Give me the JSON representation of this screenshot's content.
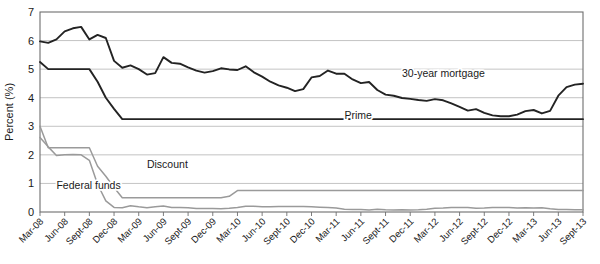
{
  "chart_data": {
    "type": "line",
    "title": "",
    "xlabel": "",
    "ylabel": "Percent (%)",
    "ylim": [
      0,
      7
    ],
    "yticks": [
      0,
      1,
      2,
      3,
      4,
      5,
      6,
      7
    ],
    "grid": true,
    "legend_position": "inline-annotations",
    "x_tick_labels": [
      "Mar-08",
      "Jun-08",
      "Sept-08",
      "Dec-08",
      "Mar-09",
      "Jun-09",
      "Sept-09",
      "Dec-09",
      "Mar-10",
      "Jun-10",
      "Sept-10",
      "Dec-10",
      "Mar-11",
      "Jun-11",
      "Sept-11",
      "Dec-11",
      "Mar-12",
      "Jun-12",
      "Sept-12",
      "Dec-12",
      "Mar-13",
      "Jun-13",
      "Sept-13"
    ],
    "x": [
      "Mar-08",
      "Apr-08",
      "May-08",
      "Jun-08",
      "Jul-08",
      "Aug-08",
      "Sept-08",
      "Oct-08",
      "Nov-08",
      "Dec-08",
      "Jan-09",
      "Feb-09",
      "Mar-09",
      "Apr-09",
      "May-09",
      "Jun-09",
      "Jul-09",
      "Aug-09",
      "Sept-09",
      "Oct-09",
      "Nov-09",
      "Dec-09",
      "Jan-10",
      "Feb-10",
      "Mar-10",
      "Apr-10",
      "May-10",
      "Jun-10",
      "Jul-10",
      "Aug-10",
      "Sept-10",
      "Oct-10",
      "Nov-10",
      "Dec-10",
      "Jan-11",
      "Feb-11",
      "Mar-11",
      "Apr-11",
      "May-11",
      "Jun-11",
      "Jul-11",
      "Aug-11",
      "Sept-11",
      "Oct-11",
      "Nov-11",
      "Dec-11",
      "Jan-12",
      "Feb-12",
      "Mar-12",
      "Apr-12",
      "May-12",
      "Jun-12",
      "Jul-12",
      "Aug-12",
      "Sept-12",
      "Oct-12",
      "Nov-12",
      "Dec-12",
      "Jan-13",
      "Feb-13",
      "Mar-13",
      "Apr-13",
      "May-13",
      "Jun-13",
      "Jul-13",
      "Aug-13",
      "Sept-13"
    ],
    "series": [
      {
        "name": "30-year mortgage",
        "color": "#232323",
        "label_anchor": {
          "x_index": 44,
          "value": 4.72
        },
        "values": [
          5.97,
          5.92,
          6.04,
          6.32,
          6.43,
          6.48,
          6.04,
          6.2,
          6.09,
          5.29,
          5.05,
          5.13,
          5.0,
          4.81,
          4.86,
          5.42,
          5.22,
          5.19,
          5.06,
          4.95,
          4.88,
          4.93,
          5.03,
          4.99,
          4.97,
          5.1,
          4.89,
          4.74,
          4.56,
          4.43,
          4.35,
          4.23,
          4.3,
          4.71,
          4.76,
          4.95,
          4.84,
          4.84,
          4.64,
          4.51,
          4.55,
          4.27,
          4.11,
          4.07,
          3.99,
          3.96,
          3.92,
          3.89,
          3.95,
          3.91,
          3.8,
          3.68,
          3.55,
          3.6,
          3.47,
          3.38,
          3.35,
          3.35,
          3.41,
          3.53,
          3.57,
          3.45,
          3.54,
          4.07,
          4.37,
          4.46,
          4.49
        ]
      },
      {
        "name": "Prime",
        "color": "#232323",
        "label_anchor": {
          "x_index": 37,
          "value": 3.25
        },
        "values": [
          5.25,
          5.0,
          5.0,
          5.0,
          5.0,
          5.0,
          5.0,
          4.56,
          4.0,
          3.61,
          3.25,
          3.25,
          3.25,
          3.25,
          3.25,
          3.25,
          3.25,
          3.25,
          3.25,
          3.25,
          3.25,
          3.25,
          3.25,
          3.25,
          3.25,
          3.25,
          3.25,
          3.25,
          3.25,
          3.25,
          3.25,
          3.25,
          3.25,
          3.25,
          3.25,
          3.25,
          3.25,
          3.25,
          3.25,
          3.25,
          3.25,
          3.25,
          3.25,
          3.25,
          3.25,
          3.25,
          3.25,
          3.25,
          3.25,
          3.25,
          3.25,
          3.25,
          3.25,
          3.25,
          3.25,
          3.25,
          3.25,
          3.25,
          3.25,
          3.25,
          3.25,
          3.25,
          3.25,
          3.25,
          3.25,
          3.25,
          3.25
        ]
      },
      {
        "name": "Discount",
        "color": "#9a9a9a",
        "label_anchor": {
          "x_index": 13,
          "value": 1.55
        },
        "values": [
          3.0,
          2.25,
          2.25,
          2.25,
          2.25,
          2.25,
          2.25,
          1.6,
          1.25,
          0.86,
          0.5,
          0.5,
          0.5,
          0.5,
          0.5,
          0.5,
          0.5,
          0.5,
          0.5,
          0.5,
          0.5,
          0.5,
          0.5,
          0.55,
          0.75,
          0.75,
          0.75,
          0.75,
          0.75,
          0.75,
          0.75,
          0.75,
          0.75,
          0.75,
          0.75,
          0.75,
          0.75,
          0.75,
          0.75,
          0.75,
          0.75,
          0.75,
          0.75,
          0.75,
          0.75,
          0.75,
          0.75,
          0.75,
          0.75,
          0.75,
          0.75,
          0.75,
          0.75,
          0.75,
          0.75,
          0.75,
          0.75,
          0.75,
          0.75,
          0.75,
          0.75,
          0.75,
          0.75,
          0.75,
          0.75,
          0.75,
          0.75
        ]
      },
      {
        "name": "Federal funds",
        "color": "#9a9a9a",
        "label_anchor": {
          "x_index": 2,
          "value": 0.82
        },
        "values": [
          2.61,
          2.28,
          1.98,
          2.0,
          2.01,
          2.0,
          1.81,
          0.97,
          0.39,
          0.16,
          0.15,
          0.22,
          0.18,
          0.15,
          0.18,
          0.21,
          0.16,
          0.16,
          0.15,
          0.12,
          0.12,
          0.12,
          0.11,
          0.13,
          0.16,
          0.2,
          0.2,
          0.18,
          0.18,
          0.19,
          0.19,
          0.19,
          0.19,
          0.18,
          0.17,
          0.16,
          0.14,
          0.1,
          0.09,
          0.09,
          0.07,
          0.1,
          0.08,
          0.07,
          0.08,
          0.07,
          0.08,
          0.1,
          0.13,
          0.14,
          0.16,
          0.16,
          0.16,
          0.13,
          0.14,
          0.16,
          0.16,
          0.16,
          0.14,
          0.15,
          0.14,
          0.15,
          0.11,
          0.09,
          0.09,
          0.08,
          0.08
        ]
      }
    ]
  }
}
